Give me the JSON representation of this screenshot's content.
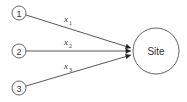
{
  "diagram": {
    "sources": [
      {
        "id": "1",
        "label": "1"
      },
      {
        "id": "2",
        "label": "2"
      },
      {
        "id": "3",
        "label": "3"
      }
    ],
    "target": {
      "label": "Site"
    },
    "edges": [
      {
        "from": "1",
        "to": "Site",
        "label": "x",
        "subscript": "1"
      },
      {
        "from": "2",
        "to": "Site",
        "label": "x",
        "subscript": "2"
      },
      {
        "from": "3",
        "to": "Site",
        "label": "x",
        "subscript": "3"
      }
    ]
  }
}
